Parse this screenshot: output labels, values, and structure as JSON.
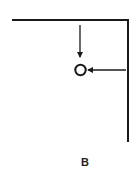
{
  "figure": {
    "panel_label": "B",
    "colors": {
      "stroke": "#1a1a1a",
      "background": "#ffffff"
    },
    "elements": {
      "corner_frame": {
        "horizontal": {
          "x1": 12,
          "y1": 20,
          "x2": 128,
          "y2": 20
        },
        "vertical": {
          "x1": 128,
          "y1": 20,
          "x2": 128,
          "y2": 142
        }
      },
      "down_arrow": {
        "x": 80,
        "y_start": 25,
        "y_end": 57
      },
      "target_circle": {
        "cx": 80.5,
        "cy": 70,
        "r": 5.2
      },
      "left_arrow": {
        "y": 70,
        "x_start": 126,
        "x_end": 88
      }
    }
  }
}
